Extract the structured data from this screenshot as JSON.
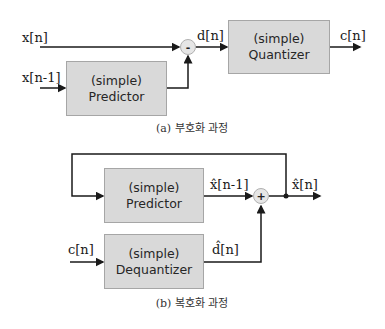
{
  "encoder": {
    "inputs": {
      "x_n": "x[n]",
      "x_n_minus_1": "x[n-1]"
    },
    "predictor": {
      "line1": "(simple)",
      "line2": "Predictor"
    },
    "subtract_op": "-",
    "diff_label": "d[n]",
    "quantizer": {
      "line1": "(simple)",
      "line2": "Quantizer"
    },
    "output_label": "c[n]",
    "caption": "(a) 부호화 과정"
  },
  "decoder": {
    "predictor": {
      "line1": "(simple)",
      "line2": "Predictor"
    },
    "pred_out_label": "x̂[n-1]",
    "add_op": "+",
    "output_label": "x̂[n]",
    "input_label": "c[n]",
    "dequantizer": {
      "line1": "(simple)",
      "line2": "Dequantizer"
    },
    "deq_out_label": "d̂[n]",
    "caption": "(b) 복호화 과정"
  },
  "colors": {
    "box_fill": "#d9d9d9",
    "line": "#1a1a1a"
  }
}
